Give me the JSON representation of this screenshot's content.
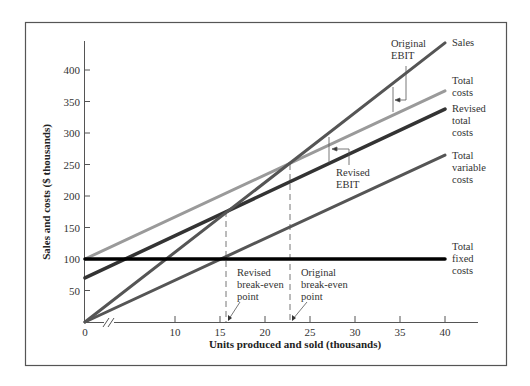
{
  "chart_data": {
    "type": "line",
    "title": "",
    "xlabel": "Units produced and sold (thousands)",
    "ylabel": "Sales and costs ($ thousands)",
    "xlim": [
      0,
      40
    ],
    "ylim": [
      0,
      440
    ],
    "x_ticks": [
      0,
      10,
      15,
      20,
      25,
      30,
      35,
      40
    ],
    "x_tick_labels": [
      "0",
      "10",
      "15",
      "20",
      "25",
      "30",
      "35",
      "40"
    ],
    "y_ticks": [
      50,
      100,
      150,
      200,
      250,
      300,
      350,
      400
    ],
    "y_tick_labels": [
      "50",
      "100",
      "150",
      "200",
      "250",
      "300",
      "350",
      "400"
    ],
    "x_axis_break": true,
    "grid": false,
    "series": [
      {
        "name": "Sales",
        "label_lines": [
          "Sales"
        ],
        "x": [
          0,
          40
        ],
        "values": [
          0,
          443
        ],
        "color": "#555555",
        "width": 3
      },
      {
        "name": "Total costs",
        "label_lines": [
          "Total",
          "costs"
        ],
        "x": [
          0,
          40
        ],
        "values": [
          100,
          367
        ],
        "color": "#9a9a9a",
        "width": 3
      },
      {
        "name": "Revised total costs",
        "label_lines": [
          "Revised",
          "total",
          "costs"
        ],
        "x": [
          0,
          40
        ],
        "values": [
          70,
          338
        ],
        "color": "#333333",
        "width": 3.5
      },
      {
        "name": "Total variable costs",
        "label_lines": [
          "Total",
          "variable",
          "costs"
        ],
        "x": [
          0,
          40
        ],
        "values": [
          0,
          265
        ],
        "color": "#555555",
        "width": 3
      },
      {
        "name": "Total fixed costs",
        "label_lines": [
          "Total",
          "fixed",
          "costs"
        ],
        "x": [
          0,
          40
        ],
        "values": [
          100,
          100
        ],
        "color": "#000000",
        "width": 3.5
      }
    ],
    "annotations": [
      {
        "label_lines": [
          "Original",
          "EBIT"
        ],
        "type": "bracket",
        "x": 35
      },
      {
        "label_lines": [
          "Revised",
          "EBIT"
        ],
        "type": "bracket",
        "x": 28
      },
      {
        "label_lines": [
          "Revised",
          "break-even",
          "point"
        ],
        "type": "dashed-vline",
        "x": 18.7,
        "y": 175
      },
      {
        "label_lines": [
          "Original",
          "break-even",
          "point"
        ],
        "type": "dashed-vline",
        "x": 25,
        "y": 250
      }
    ]
  }
}
